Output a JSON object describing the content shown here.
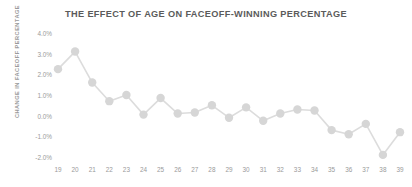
{
  "chart_data": {
    "type": "line",
    "title": "THE EFFECT OF AGE ON FACEOFF-WINNING PERCENTAGE",
    "xlabel": "",
    "ylabel": "CHANGE IN FACEOFF PERCENTAGE",
    "x": [
      19,
      20,
      21,
      22,
      23,
      24,
      25,
      26,
      27,
      28,
      29,
      30,
      31,
      32,
      33,
      34,
      35,
      36,
      37,
      38,
      39
    ],
    "categories": [
      "19",
      "20",
      "21",
      "22",
      "23",
      "24",
      "25",
      "26",
      "27",
      "28",
      "29",
      "30",
      "31",
      "32",
      "33",
      "34",
      "35",
      "36",
      "37",
      "38",
      "39"
    ],
    "values": [
      2.3,
      3.15,
      1.65,
      0.75,
      1.05,
      0.1,
      0.9,
      0.15,
      0.2,
      0.55,
      -0.05,
      0.45,
      -0.2,
      0.15,
      0.35,
      0.3,
      -0.65,
      -0.85,
      -0.35,
      -1.85,
      -0.75
    ],
    "ylim": [
      -2.0,
      4.0
    ],
    "yticks": [
      4.0,
      3.0,
      2.0,
      1.0,
      0.0,
      -1.0,
      -2.0
    ],
    "ytick_labels": [
      "4.0%",
      "3.0%",
      "2.0%",
      "1.0%",
      "0.0%",
      "-1.0%",
      "-2.0%"
    ],
    "xlim": [
      19,
      39
    ],
    "xticks": [
      19,
      20,
      21,
      22,
      23,
      24,
      25,
      26,
      27,
      28,
      29,
      30,
      31,
      32,
      33,
      34,
      35,
      36,
      37,
      38,
      39
    ],
    "grid": false,
    "legend": null,
    "series": [
      {
        "name": "Change in faceoff percentage",
        "values": [
          2.3,
          3.15,
          1.65,
          0.75,
          1.05,
          0.1,
          0.9,
          0.15,
          0.2,
          0.55,
          -0.05,
          0.45,
          -0.2,
          0.15,
          0.35,
          0.3,
          -0.65,
          -0.85,
          -0.35,
          -1.85,
          -0.75
        ]
      }
    ],
    "colors": {
      "line": "#dcdcdc",
      "marker": "#d6d6d6",
      "title_text": "#5b5b5b",
      "tick_text": "#9a9a9a",
      "background": "#ffffff"
    },
    "marker": "circle",
    "marker_size": 4.2,
    "line_width": 1.6
  },
  "layout": {
    "plot_left": 58,
    "plot_right": 400,
    "plot_top": 34,
    "plot_bottom": 158
  }
}
